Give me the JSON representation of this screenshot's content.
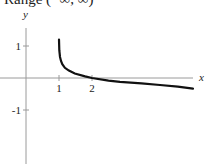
{
  "header": {
    "clipped_text": "Range (−∞, ∞)"
  },
  "chart_data": {
    "type": "line",
    "title": "",
    "xlabel": "x",
    "ylabel": "y",
    "x_ticks": [
      {
        "value": 1,
        "label": "1"
      },
      {
        "value": 2,
        "label": "2"
      }
    ],
    "y_ticks": [
      {
        "value": 1,
        "label": "1"
      },
      {
        "value": -1,
        "label": "-1"
      }
    ],
    "xlim": [
      -1.0,
      5.3
    ],
    "ylim": [
      -2.7,
      2.2
    ],
    "grid": false,
    "series": [
      {
        "name": "f(x)",
        "description": "decreasing log-like curve, vertical near x=1, through (2,0)",
        "x": [
          1.0,
          1.01,
          1.03,
          1.06,
          1.1,
          1.18,
          1.3,
          1.48,
          1.79,
          2.0,
          2.5,
          2.85,
          3.5,
          4.06,
          4.6,
          5.06
        ],
        "y": [
          1.2,
          0.87,
          0.66,
          0.53,
          0.43,
          0.32,
          0.23,
          0.14,
          0.05,
          0.0,
          -0.08,
          -0.12,
          -0.17,
          -0.22,
          -0.27,
          -0.33
        ]
      }
    ]
  },
  "layout": {
    "origin_px": [
      26,
      78
    ],
    "unit_px_x": 33,
    "unit_px_y": 32,
    "axis_x_end_px": 193,
    "axis_y_top_px": 28
  }
}
